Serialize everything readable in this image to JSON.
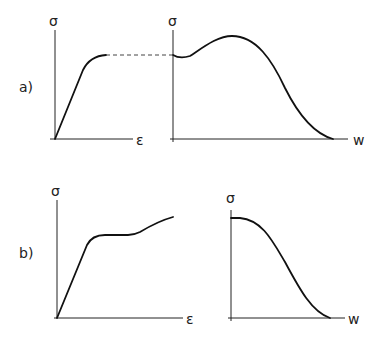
{
  "panels": {
    "a": {
      "label": "a)",
      "left": {
        "y_label": "σ",
        "x_label": "ε",
        "description": "stress-strain curve rising linearly then plateau"
      },
      "right": {
        "y_label": "σ",
        "x_label": "w",
        "description": "stress-crack opening curve with dip, hump, then softening to zero"
      },
      "connector": "dashed line linking plateau stress to initial σ of right plot"
    },
    "b": {
      "label": "b)",
      "left": {
        "y_label": "σ",
        "x_label": "ε",
        "description": "stress-strain curve rising linearly, plateau, then hardening"
      },
      "right": {
        "y_label": "σ",
        "x_label": "w",
        "description": "stress-crack opening curve with monotonic softening to zero"
      }
    }
  },
  "colors": {
    "line": "#111111",
    "background": "#ffffff"
  }
}
